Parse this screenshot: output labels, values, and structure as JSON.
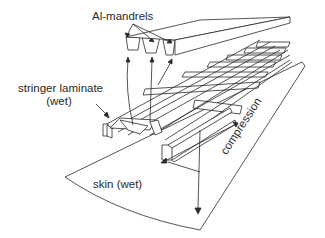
{
  "diagram": {
    "labels": {
      "mandrels": "Al-mandrels",
      "stringer_line1": "stringer laminate",
      "stringer_line2": "(wet)",
      "skin": "skin (wet)",
      "compression": "compression"
    },
    "colors": {
      "line": "#2a2a2a",
      "background": "#ffffff"
    }
  }
}
